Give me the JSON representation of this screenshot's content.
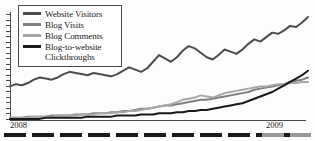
{
  "chart_data": {
    "type": "line",
    "title": "",
    "xlabel": "",
    "ylabel": "",
    "grid": false,
    "legend_position": "top-left",
    "axis": {
      "x_tick_labels": [
        "2008",
        "2009"
      ],
      "y_tick_labels": [],
      "y_tick_count": 20,
      "ylim": [
        0,
        100
      ],
      "xlim": [
        0,
        100
      ]
    },
    "series": [
      {
        "name": "Website Visitors",
        "color": "#4d4d4d",
        "x": [
          0,
          2,
          4,
          6,
          8,
          10,
          12,
          14,
          16,
          18,
          20,
          22,
          24,
          26,
          28,
          30,
          32,
          34,
          36,
          38,
          40,
          42,
          44,
          46,
          48,
          50,
          52,
          54,
          56,
          58,
          60,
          62,
          64,
          66,
          68,
          70,
          72,
          74,
          76,
          78,
          80,
          82,
          84,
          86,
          88,
          90,
          92,
          94,
          96,
          98,
          100
        ],
        "values": [
          30,
          32,
          31,
          33,
          36,
          38,
          37,
          36,
          38,
          41,
          43,
          42,
          41,
          40,
          42,
          41,
          40,
          39,
          41,
          44,
          47,
          45,
          43,
          46,
          52,
          58,
          55,
          52,
          56,
          62,
          66,
          64,
          60,
          56,
          54,
          58,
          63,
          61,
          59,
          63,
          68,
          72,
          70,
          74,
          78,
          77,
          80,
          84,
          83,
          87,
          92
        ]
      },
      {
        "name": "Blog Visits",
        "color": "#808080",
        "x": [
          0,
          2,
          4,
          6,
          8,
          10,
          12,
          14,
          16,
          18,
          20,
          22,
          24,
          26,
          28,
          30,
          32,
          34,
          36,
          38,
          40,
          42,
          44,
          46,
          48,
          50,
          52,
          54,
          56,
          58,
          60,
          62,
          64,
          66,
          68,
          70,
          72,
          74,
          76,
          78,
          80,
          82,
          84,
          86,
          88,
          90,
          92,
          94,
          96,
          98,
          100
        ],
        "values": [
          2,
          2,
          2,
          3,
          3,
          3,
          3,
          4,
          4,
          4,
          4,
          5,
          5,
          5,
          6,
          6,
          6,
          7,
          7,
          8,
          8,
          9,
          10,
          10,
          11,
          12,
          13,
          13,
          14,
          15,
          16,
          17,
          18,
          18,
          19,
          20,
          21,
          22,
          23,
          24,
          25,
          27,
          28,
          29,
          30,
          31,
          32,
          34,
          35,
          36,
          38
        ]
      },
      {
        "name": "Blog Comments",
        "color": "#a8a8a8",
        "x": [
          0,
          2,
          4,
          6,
          8,
          10,
          12,
          14,
          16,
          18,
          20,
          22,
          24,
          26,
          28,
          30,
          32,
          34,
          36,
          38,
          40,
          42,
          44,
          46,
          48,
          50,
          52,
          54,
          56,
          58,
          60,
          62,
          64,
          66,
          68,
          70,
          72,
          74,
          76,
          78,
          80,
          82,
          84,
          86,
          88,
          90,
          92,
          94,
          96,
          98,
          100
        ],
        "values": [
          2,
          2,
          2,
          2,
          3,
          3,
          3,
          3,
          4,
          4,
          4,
          4,
          5,
          5,
          5,
          6,
          6,
          6,
          7,
          7,
          8,
          8,
          9,
          10,
          11,
          12,
          13,
          14,
          16,
          18,
          19,
          20,
          22,
          21,
          20,
          22,
          24,
          25,
          26,
          27,
          28,
          29,
          30,
          30,
          31,
          32,
          32,
          33,
          33,
          34,
          34
        ]
      },
      {
        "name": "Blog-to-website Clickthroughs",
        "color": "#1a1a1a",
        "x": [
          0,
          2,
          4,
          6,
          8,
          10,
          12,
          14,
          16,
          18,
          20,
          22,
          24,
          26,
          28,
          30,
          32,
          34,
          36,
          38,
          40,
          42,
          44,
          46,
          48,
          50,
          52,
          54,
          56,
          58,
          60,
          62,
          64,
          66,
          68,
          70,
          72,
          74,
          76,
          78,
          80,
          82,
          84,
          86,
          88,
          90,
          92,
          94,
          96,
          98,
          100
        ],
        "values": [
          1,
          1,
          1,
          1,
          1,
          1,
          2,
          2,
          2,
          2,
          2,
          2,
          2,
          3,
          3,
          3,
          3,
          3,
          4,
          4,
          4,
          4,
          5,
          5,
          5,
          6,
          6,
          6,
          7,
          7,
          8,
          8,
          9,
          9,
          10,
          11,
          12,
          13,
          14,
          15,
          17,
          19,
          21,
          23,
          25,
          28,
          31,
          34,
          37,
          40,
          44
        ]
      }
    ]
  },
  "legend": {
    "items": [
      {
        "label": "Website Visitors",
        "color": "#4d4d4d"
      },
      {
        "label": "Blog Visits",
        "color": "#808080"
      },
      {
        "label": "Blog Comments",
        "color": "#a8a8a8"
      },
      {
        "label": "Blog-to-website\nClickthroughs",
        "color": "#1a1a1a"
      }
    ]
  },
  "x_axis": {
    "left_label": "2008",
    "right_label": "2009"
  }
}
